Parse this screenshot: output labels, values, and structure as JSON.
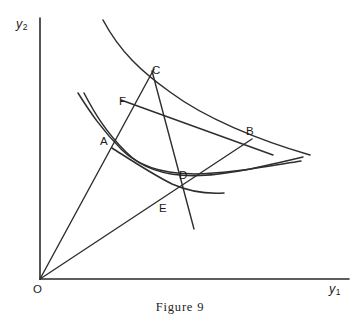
{
  "figure": {
    "caption": "Figure 9",
    "background_color": "#ffffff",
    "ink_color": "#2e2e2e"
  },
  "axes": {
    "y_axis": {
      "name": "vertical-axis",
      "label_text": "y",
      "label_sub": "2",
      "label_x": 16,
      "label_y": 18,
      "x": 40,
      "y_top": 18,
      "y_bottom": 279
    },
    "x_axis": {
      "name": "horizontal-axis",
      "label_text": "y",
      "label_sub": "1",
      "label_x": 329,
      "label_y": 283,
      "y": 279,
      "x_left": 40,
      "x_right": 349
    },
    "origin": {
      "label": "O",
      "label_x": 33,
      "label_y": 284,
      "x": 40,
      "y": 279
    }
  },
  "points": [
    {
      "id": "A",
      "label": "A",
      "x": 113,
      "y": 145,
      "label_x": 100,
      "label_y": 136
    },
    {
      "id": "B",
      "label": "B",
      "x": 248,
      "y": 142,
      "label_x": 246,
      "label_y": 126
    },
    {
      "id": "C",
      "label": "C",
      "x": 148,
      "y": 79,
      "label_x": 152,
      "label_y": 65
    },
    {
      "id": "D",
      "label": "D",
      "x": 181,
      "y": 188,
      "label_x": 179,
      "label_y": 170
    },
    {
      "id": "E",
      "label": "E",
      "x": 166,
      "y": 196,
      "label_x": 159,
      "label_y": 203
    },
    {
      "id": "F",
      "label": "F",
      "x": 133,
      "y": 104,
      "label_x": 119,
      "label_y": 96
    }
  ],
  "curves": [
    {
      "id": "upper-indifference-curve",
      "name": "curve-upper-through-C-B",
      "path": "M 103,20 C 120,52 142,72 170,92 C 205,118 258,140 310,155"
    },
    {
      "id": "middle-indifference-curve-outer",
      "name": "curve-middle-through-A-B",
      "path": "M 78,93 C 90,112 102,130 122,150 C 160,187 225,173 301,161"
    },
    {
      "id": "middle-indifference-curve-inner",
      "name": "curve-middle-inner-through-A",
      "path": "M 84,93 C 95,114 106,132 126,152 C 163,190 228,175 303,157"
    },
    {
      "id": "lower-indifference-curve",
      "name": "curve-lower-through-D",
      "path": "M 112,148 C 134,162 152,174 172,184 C 190,192 208,194 224,193"
    }
  ],
  "rays": [
    {
      "id": "ray-O-A-C",
      "name": "ray-from-origin-through-A-to-C",
      "x1": 40,
      "y1": 279,
      "x2": 154,
      "y2": 69
    },
    {
      "id": "ray-O-E-B",
      "name": "ray-from-origin-through-E-to-B",
      "x1": 40,
      "y1": 279,
      "x2": 252,
      "y2": 139
    }
  ],
  "chords": [
    {
      "id": "line-C-F-E",
      "name": "price-line-through-C-F-E",
      "x1": 152,
      "y1": 71,
      "x2": 194,
      "y2": 229
    },
    {
      "id": "line-F-B",
      "name": "budget-line-through-F-to-B",
      "x1": 121,
      "y1": 100,
      "x2": 273,
      "y2": 155
    }
  ]
}
